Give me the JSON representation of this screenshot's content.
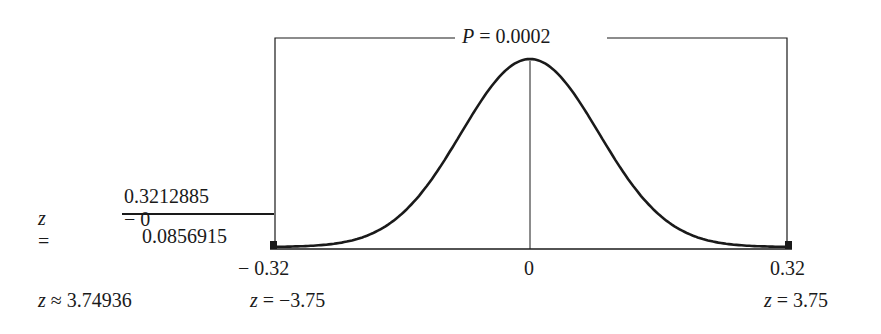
{
  "diagram": {
    "type": "normal-curve-two-tailed",
    "p_label": "P = 0.0002",
    "p_symbol": "P",
    "p_value": "= 0.0002",
    "axis_labels": {
      "left": "− 0.32",
      "center": "0",
      "right": "0.32"
    },
    "z_labels": {
      "left": "z = −3.75",
      "left_sym": "z",
      "left_val": "= −3.75",
      "right_sym": "z",
      "right_val": "= 3.75"
    },
    "formula": {
      "lhs_sym": "z",
      "lhs_eq": " =",
      "numerator": "0.3212885 − 0",
      "denominator": "0.0856915",
      "result_sym": "z",
      "result_val": " ≈ 3.74936"
    },
    "colors": {
      "ink": "#1a1a1a",
      "background": "#ffffff"
    }
  }
}
